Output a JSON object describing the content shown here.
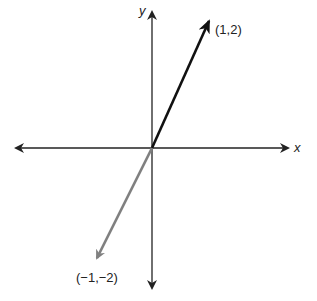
{
  "axes": {
    "x_label": "x",
    "y_label": "y",
    "axis_color": "#222222"
  },
  "vectors": [
    {
      "label": "(1,2)",
      "x": 1,
      "y": 2,
      "color": "#111111"
    },
    {
      "label": "(−1,−2)",
      "x": -1,
      "y": -2,
      "color": "#808080"
    }
  ]
}
